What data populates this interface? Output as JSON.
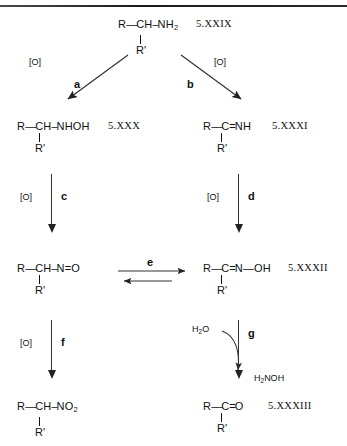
{
  "figure": {
    "type": "reaction-scheme",
    "divider": "top-rule"
  },
  "compounds": [
    {
      "id": "amine",
      "label": "5.XXIX",
      "name": "primary-amine",
      "left_group": "R",
      "bond1": "—",
      "center": "CH",
      "bond2": "–",
      "right_group": "NH",
      "right_sub": "2",
      "branch": "R'"
    },
    {
      "id": "hydroxylamine",
      "label": "5.XXX",
      "name": "n-hydroxylamine",
      "left_group": "R",
      "bond1": "—",
      "center": "CH",
      "bond2": "–",
      "right_group": "NHOH",
      "right_sub": "",
      "branch": "R'"
    },
    {
      "id": "imine",
      "label": "5.XXXI",
      "name": "imine",
      "left_group": "R",
      "bond1": "—",
      "center": "C",
      "bond2": "=",
      "right_group": "NH",
      "right_sub": "",
      "branch": "R'"
    },
    {
      "id": "nitroso",
      "label": "",
      "name": "nitroso-compound",
      "left_group": "R",
      "bond1": "—",
      "center": "CH",
      "bond2": "–",
      "right_group": "N=O",
      "right_sub": "",
      "branch": "R'"
    },
    {
      "id": "oxime",
      "label": "5.XXXII",
      "name": "oxime",
      "left_group": "R",
      "bond1": "—",
      "center": "C",
      "bond2": "=",
      "right_group": "N—OH",
      "right_sub": "",
      "branch": "R'"
    },
    {
      "id": "nitro",
      "label": "",
      "name": "nitro-compound",
      "left_group": "R",
      "bond1": "—",
      "center": "CH",
      "bond2": "–",
      "right_group": "NO",
      "right_sub": "2",
      "branch": "R'"
    },
    {
      "id": "carbonyl",
      "label": "5.XXXIII",
      "name": "ketone",
      "left_group": "R",
      "bond1": "—",
      "center": "C",
      "bond2": "=",
      "right_group": "O",
      "right_sub": "",
      "branch": "R'"
    }
  ],
  "steps": [
    {
      "key": "a",
      "label": "a",
      "reagent": "[O]",
      "arrow": "diagonal-down-left"
    },
    {
      "key": "b",
      "label": "b",
      "reagent": "[O]",
      "arrow": "diagonal-down-right"
    },
    {
      "key": "c",
      "label": "c",
      "reagent": "[O]",
      "arrow": "vertical-down"
    },
    {
      "key": "d",
      "label": "d",
      "reagent": "[O]",
      "arrow": "vertical-down"
    },
    {
      "key": "e",
      "label": "e",
      "reagent": "",
      "arrow": "equilibrium-horizontal"
    },
    {
      "key": "f",
      "label": "f",
      "reagent": "[O]",
      "arrow": "vertical-down"
    },
    {
      "key": "g",
      "label": "g",
      "reagent": "",
      "arrow": "vertical-down-with-curve"
    }
  ],
  "reagents": {
    "oxidant": "[O]",
    "water_main": "H",
    "water_sub": "2",
    "water_tail": "O",
    "hydroxylamine_main": "H",
    "hydroxylamine_sub": "2",
    "hydroxylamine_tail": "NOH"
  },
  "colors": {
    "ink": "#111111",
    "arrow": "#333333",
    "rule": "#1a1a1a",
    "background": "#ffffff"
  }
}
